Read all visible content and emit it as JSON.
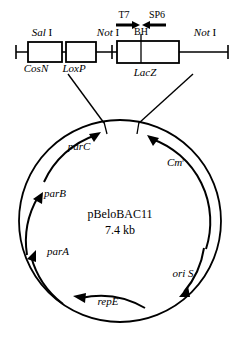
{
  "figure": {
    "stroke_color": "#000000",
    "background_color": "#ffffff"
  },
  "linear_map": {
    "restriction_sites": [
      {
        "id": "sal-i",
        "gene_italic": "Sal",
        "numeral": "I",
        "x": 42,
        "y": 36
      },
      {
        "id": "not-i-1",
        "gene_italic": "Not",
        "numeral": "I",
        "x": 108,
        "y": 36
      },
      {
        "id": "not-i-2",
        "gene_italic": "Not",
        "numeral": "I",
        "x": 205,
        "y": 36
      }
    ],
    "features": [
      {
        "id": "cosn",
        "label": "CosN",
        "x": 36,
        "y": 62
      },
      {
        "id": "loxp",
        "label": "LoxP",
        "x": 70,
        "y": 62
      },
      {
        "id": "lacz",
        "label": "LacZ",
        "x": 145,
        "y": 64
      }
    ],
    "promoters": [
      {
        "id": "t7",
        "label": "T7",
        "x": 124,
        "y": 17,
        "arrow_direction": "right"
      },
      {
        "id": "sp6",
        "label": "SP6",
        "x": 155,
        "y": 17,
        "arrow_direction": "left"
      }
    ],
    "inner_site": {
      "id": "bamhi",
      "label": "BH",
      "x": 141,
      "y": 33
    }
  },
  "plasmid": {
    "name": "pBeloBAC11",
    "size": "7.4 kb",
    "center_x": 120,
    "center_y": 221,
    "radius": 101,
    "genes": [
      {
        "id": "parc",
        "label": "parC",
        "label_x": 79,
        "label_y": 146,
        "superscript": "",
        "direction": "clockwise"
      },
      {
        "id": "cmr",
        "label": "Cm",
        "label_x": 176,
        "label_y": 162,
        "superscript": "r",
        "direction": "counterclockwise"
      },
      {
        "id": "parb",
        "label": "parB",
        "label_x": 53,
        "label_y": 193,
        "superscript": "",
        "direction": "clockwise"
      },
      {
        "id": "para",
        "label": "parA",
        "label_x": 56,
        "label_y": 251,
        "superscript": "",
        "direction": "clockwise"
      },
      {
        "id": "oris",
        "label": "ori S",
        "label_x": 183,
        "label_y": 273,
        "superscript": "",
        "direction": "clockwise"
      },
      {
        "id": "repe",
        "label": "repE",
        "label_x": 105,
        "label_y": 307,
        "superscript": "",
        "direction": "counterclockwise"
      }
    ]
  }
}
